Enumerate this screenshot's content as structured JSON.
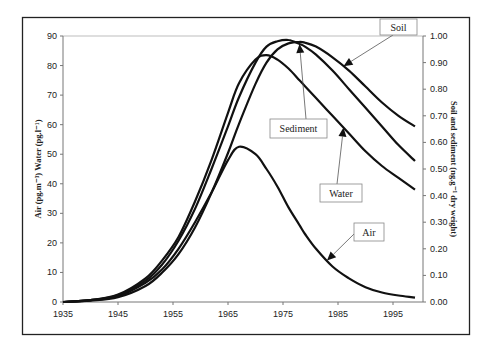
{
  "chart_data": {
    "type": "line",
    "title": "",
    "xlabel": "",
    "ylabel": "Air (pg.m⁻³) Water (pg.l⁻¹)",
    "y2label": "Soil and sediment (ng.g⁻¹ dry weight)",
    "xlim": [
      1935,
      1999
    ],
    "ylim": [
      0,
      90
    ],
    "y2lim": [
      0,
      1.0
    ],
    "grid": false,
    "legend": "callout-labels",
    "x_ticks": [
      "1935",
      "1945",
      "1955",
      "1965",
      "1975",
      "1985",
      "1995"
    ],
    "x_tick_values": [
      1935,
      1945,
      1955,
      1965,
      1975,
      1985,
      1995
    ],
    "y_ticks": [
      "0",
      "10",
      "20",
      "30",
      "40",
      "50",
      "60",
      "70",
      "80",
      "90"
    ],
    "y_tick_values": [
      0,
      10,
      20,
      30,
      40,
      50,
      60,
      70,
      80,
      90
    ],
    "y2_ticks": [
      "0.00",
      "0.10",
      "0.20",
      "0.30",
      "0.40",
      "0.50",
      "0.60",
      "0.70",
      "0.80",
      "0.90",
      "1.00"
    ],
    "y2_tick_values": [
      0,
      0.1,
      0.2,
      0.3,
      0.4,
      0.5,
      0.6,
      0.7,
      0.8,
      0.9,
      1.0
    ],
    "x": [
      1935,
      1940,
      1945,
      1950,
      1953,
      1956,
      1959,
      1962,
      1965,
      1967,
      1970,
      1972,
      1974,
      1976,
      1978,
      1979,
      1981,
      1984,
      1987,
      1990,
      1993,
      1996,
      1999
    ],
    "series": [
      {
        "name": "Air",
        "axis": "left",
        "values": [
          0,
          0.6,
          2,
          6.5,
          11,
          18,
          27,
          37,
          48,
          52.5,
          50,
          45,
          39,
          32,
          26,
          23,
          18,
          12,
          8,
          5,
          3.2,
          2.2,
          1.5
        ]
      },
      {
        "name": "Water",
        "axis": "left",
        "values": [
          0,
          0.6,
          2.5,
          8,
          14,
          22,
          34,
          48,
          64,
          74,
          82,
          83.5,
          82,
          79,
          75,
          73,
          69,
          63,
          57,
          51,
          46,
          42,
          38
        ]
      },
      {
        "name": "Sediment",
        "axis": "right",
        "values": [
          0,
          0.007,
          0.025,
          0.08,
          0.14,
          0.23,
          0.35,
          0.5,
          0.66,
          0.77,
          0.9,
          0.96,
          0.98,
          0.985,
          0.97,
          0.96,
          0.93,
          0.87,
          0.8,
          0.73,
          0.66,
          0.59,
          0.53
        ]
      },
      {
        "name": "Soil",
        "axis": "right",
        "values": [
          0,
          0.005,
          0.018,
          0.06,
          0.11,
          0.18,
          0.28,
          0.41,
          0.56,
          0.67,
          0.82,
          0.9,
          0.95,
          0.972,
          0.978,
          0.975,
          0.96,
          0.92,
          0.87,
          0.81,
          0.75,
          0.7,
          0.66
        ]
      }
    ],
    "annotations": [
      {
        "label": "Soil",
        "series": "Soil",
        "arrow_to_year": 1986
      },
      {
        "label": "Sediment",
        "series": "Sediment",
        "arrow_to_year": 1978
      },
      {
        "label": "Water",
        "series": "Water",
        "arrow_to_year": 1986
      },
      {
        "label": "Air",
        "series": "Air",
        "arrow_to_year": 1983
      }
    ]
  }
}
